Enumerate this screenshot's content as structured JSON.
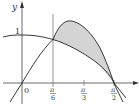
{
  "figure": {
    "axes": {
      "x_label": "x",
      "y_label": "y",
      "origin_label": "0",
      "y_tick_label": "1",
      "x_ticks": [
        {
          "num": "π",
          "den": "6"
        },
        {
          "num": "π",
          "den": "3"
        },
        {
          "num": "π",
          "den": "2"
        }
      ]
    },
    "curves": [
      {
        "name": "y = cos x"
      },
      {
        "name": "y = sin 2x"
      }
    ],
    "shaded_region": "between y = sin 2x and y = cos x from π/6 to π/2",
    "colors": {
      "axis": "#333333",
      "curve": "#222222",
      "shade": "#d4d4d4"
    }
  }
}
